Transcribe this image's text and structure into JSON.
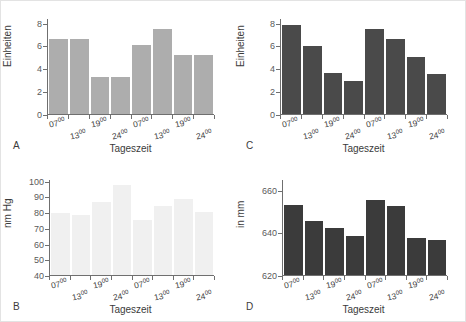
{
  "figure": {
    "title": "",
    "background_color": "#ffffff",
    "border_color": "#e3e3e3"
  },
  "shared": {
    "xlabel": "Tageszeit",
    "xtick_labels": [
      "07",
      "13",
      "19",
      "24",
      "07",
      "13",
      "19",
      "24"
    ],
    "xtick_superscript": "00"
  },
  "panels": {
    "a": {
      "letter": "A",
      "ylabel": "Einheiten",
      "bar_color": "#adadad",
      "yticks": [
        "0",
        "2",
        "4",
        "6",
        "8"
      ]
    },
    "b": {
      "letter": "B",
      "ylabel": "nm Hg",
      "bar_color": "#f0f0f0",
      "yticks": [
        "40",
        "50",
        "60",
        "70",
        "80",
        "90",
        "100"
      ]
    },
    "c": {
      "letter": "C",
      "ylabel": "Einheiten",
      "bar_color": "#4a4a4a",
      "yticks": [
        "0",
        "2",
        "4",
        "6",
        "8"
      ]
    },
    "d": {
      "letter": "D",
      "ylabel": "in mm",
      "bar_color": "#3b3b3b",
      "yticks": [
        "620",
        "640",
        "660"
      ]
    }
  },
  "chart_data": [
    {
      "id": "A",
      "type": "bar",
      "title": "",
      "xlabel": "Tageszeit",
      "ylabel": "Einheiten",
      "categories": [
        "07:00",
        "13:00",
        "19:00",
        "24:00",
        "07:00",
        "13:00",
        "19:00",
        "24:00"
      ],
      "values": [
        6.6,
        6.6,
        3.25,
        3.25,
        6.1,
        7.55,
        5.2,
        5.2
      ],
      "ylim": [
        0,
        8.4
      ],
      "yticks": [
        0,
        2,
        4,
        6,
        8
      ],
      "grid": false,
      "legend": "none",
      "bar_color": "#adadad"
    },
    {
      "id": "B",
      "type": "bar",
      "title": "",
      "xlabel": "Tageszeit",
      "ylabel": "nm Hg",
      "categories": [
        "07:00",
        "13:00",
        "19:00",
        "24:00",
        "07:00",
        "13:00",
        "19:00",
        "24:00"
      ],
      "values": [
        80.0,
        78.5,
        87.0,
        97.5,
        75.5,
        84.0,
        89.0,
        80.5
      ],
      "ylim": [
        40,
        101
      ],
      "yticks": [
        40,
        50,
        60,
        70,
        80,
        90,
        100
      ],
      "grid": false,
      "legend": "none",
      "bar_color": "#f0f0f0"
    },
    {
      "id": "C",
      "type": "bar",
      "title": "",
      "xlabel": "Tageszeit",
      "ylabel": "Einheiten",
      "categories": [
        "07:00",
        "13:00",
        "19:00",
        "24:00",
        "07:00",
        "13:00",
        "19:00",
        "24:00"
      ],
      "values": [
        7.9,
        6.05,
        3.65,
        2.95,
        7.55,
        6.6,
        5.05,
        3.55
      ],
      "ylim": [
        0,
        8.4
      ],
      "yticks": [
        0,
        2,
        4,
        6,
        8
      ],
      "grid": false,
      "legend": "none",
      "bar_color": "#4a4a4a"
    },
    {
      "id": "D",
      "type": "bar",
      "title": "",
      "xlabel": "Tageszeit",
      "ylabel": "in mm",
      "categories": [
        "07:00",
        "13:00",
        "19:00",
        "24:00",
        "07:00",
        "13:00",
        "19:00",
        "24:00"
      ],
      "values": [
        653.0,
        645.5,
        642.5,
        638.5,
        655.5,
        652.5,
        637.5,
        636.5
      ],
      "ylim": [
        620,
        665
      ],
      "yticks": [
        620,
        640,
        660
      ],
      "grid": false,
      "legend": "none",
      "bar_color": "#3b3b3b"
    }
  ]
}
